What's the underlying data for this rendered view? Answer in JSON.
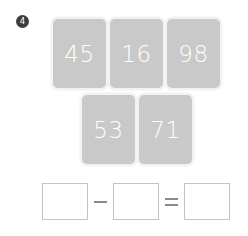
{
  "worksheet": {
    "question_number": "4",
    "cards": {
      "row1": [
        "45",
        "16",
        "98"
      ],
      "row2": [
        "53",
        "71"
      ]
    },
    "equation": {
      "box1_value": "",
      "operator1": "−",
      "box2_value": "",
      "operator2": "=",
      "box3_value": "",
      "operator1_name": "minus",
      "operator2_name": "equals"
    },
    "colors": {
      "card_fill": "#c9c9c9",
      "card_glow": "#f2f2f2",
      "card_text": "#ffffff",
      "badge_fill": "#3d3d3d",
      "badge_text": "#ffffff",
      "box_border": "#c4c4c4",
      "operator": "#8a8a8a",
      "page_background": "#ffffff"
    }
  }
}
